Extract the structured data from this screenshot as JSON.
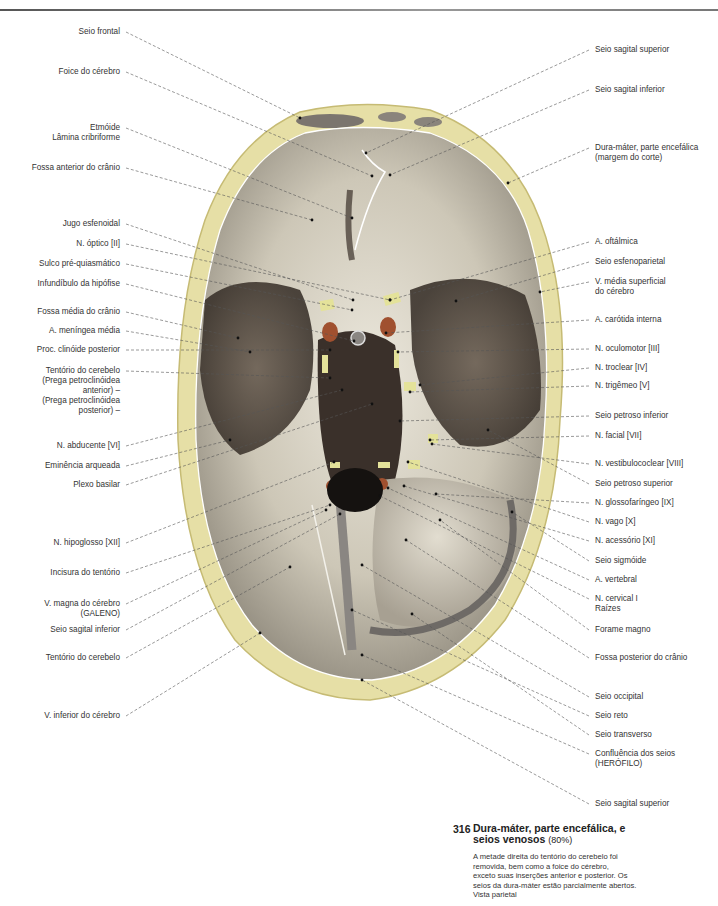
{
  "figure": {
    "number": "316",
    "title_line1": "Dura-máter, parte encefálica, e",
    "title_line2": "seios venosos",
    "scale": "(80%)",
    "description": [
      "A metade direita do tentório do cerebelo foi",
      "removida, bem como a foice do cérebro,",
      "exceto suas inserções anterior e posterior. Os",
      "seios da dura-máter estão parcialmente abertos.",
      "Vista parietal"
    ]
  },
  "labels_left": [
    {
      "lines": [
        "Seio frontal"
      ],
      "x": 120,
      "y": 32,
      "tx": 300,
      "ty": 118
    },
    {
      "lines": [
        "Foice do cérebro"
      ],
      "x": 120,
      "y": 72,
      "tx": 372,
      "ty": 176
    },
    {
      "lines": [
        "Etmóide",
        "Lâmina cribriforme"
      ],
      "x": 120,
      "y": 128,
      "tx": 352,
      "ty": 218
    },
    {
      "lines": [
        "Fossa anterior do crânio"
      ],
      "x": 120,
      "y": 168,
      "tx": 312,
      "ty": 220
    },
    {
      "lines": [
        "Jugo esfenoidal"
      ],
      "x": 120,
      "y": 224,
      "tx": 353,
      "ty": 300
    },
    {
      "lines": [
        "N. óptico [II]"
      ],
      "x": 120,
      "y": 244,
      "tx": 390,
      "ty": 300
    },
    {
      "lines": [
        "Sulco pré-quiasmático"
      ],
      "x": 120,
      "y": 264,
      "tx": 352,
      "ty": 310
    },
    {
      "lines": [
        "Infundíbulo da hipófise"
      ],
      "x": 120,
      "y": 284,
      "tx": 354,
      "ty": 341
    },
    {
      "lines": [
        "Fossa média do crânio"
      ],
      "x": 120,
      "y": 312,
      "tx": 238,
      "ty": 338
    },
    {
      "lines": [
        "A. meníngea média"
      ],
      "x": 120,
      "y": 331,
      "tx": 250,
      "ty": 352
    },
    {
      "lines": [
        "Proc. clinóide posterior"
      ],
      "x": 120,
      "y": 350,
      "tx": 330,
      "ty": 350
    },
    {
      "lines": [
        "Tentório do cerebelo",
        "(Prega petroclinóidea",
        "anterior) –",
        "(Prega petroclinóidea",
        "posterior) –"
      ],
      "x": 120,
      "y": 371,
      "tx": 330,
      "ty": 378
    },
    {
      "lines": [
        "N. abducente [VI]"
      ],
      "x": 120,
      "y": 446,
      "tx": 342,
      "ty": 390
    },
    {
      "lines": [
        "Eminência arqueada"
      ],
      "x": 120,
      "y": 466,
      "tx": 230,
      "ty": 440
    },
    {
      "lines": [
        "Plexo basilar"
      ],
      "x": 120,
      "y": 485,
      "tx": 372,
      "ty": 404
    },
    {
      "lines": [
        "N. hipoglosso [XII]"
      ],
      "x": 120,
      "y": 543,
      "tx": 334,
      "ty": 462
    },
    {
      "lines": [
        "Incisura do tentório"
      ],
      "x": 120,
      "y": 573,
      "tx": 330,
      "ty": 505
    },
    {
      "lines": [
        "V. magna do cérebro",
        "(GALENO)"
      ],
      "x": 120,
      "y": 604,
      "tx": 326,
      "ty": 510
    },
    {
      "lines": [
        "Seio sagital inferior"
      ],
      "x": 120,
      "y": 630,
      "tx": 340,
      "ty": 514
    },
    {
      "lines": [
        "Tentório do cerebelo"
      ],
      "x": 120,
      "y": 658,
      "tx": 290,
      "ty": 567
    },
    {
      "lines": [
        "V. inferior do cérebro"
      ],
      "x": 120,
      "y": 716,
      "tx": 260,
      "ty": 633
    }
  ],
  "labels_right": [
    {
      "lines": [
        "Seio sagital superior"
      ],
      "x": 595,
      "y": 50,
      "tx": 366,
      "ty": 153
    },
    {
      "lines": [
        "Seio sagital inferior"
      ],
      "x": 595,
      "y": 90,
      "tx": 390,
      "ty": 175
    },
    {
      "lines": [
        "Dura-máter, parte encefálica",
        "(margem do corte)"
      ],
      "x": 595,
      "y": 148,
      "tx": 508,
      "ty": 183
    },
    {
      "lines": [
        "A. oftálmica"
      ],
      "x": 595,
      "y": 242,
      "tx": 390,
      "ty": 300
    },
    {
      "lines": [
        "Seio esfenoparietal"
      ],
      "x": 595,
      "y": 262,
      "tx": 456,
      "ty": 301
    },
    {
      "lines": [
        "V. média superficial",
        "do cérebro"
      ],
      "x": 595,
      "y": 282,
      "tx": 540,
      "ty": 292
    },
    {
      "lines": [
        "A. carótida interna"
      ],
      "x": 595,
      "y": 320,
      "tx": 386,
      "ty": 333
    },
    {
      "lines": [
        "N. oculomotor [III]"
      ],
      "x": 595,
      "y": 349,
      "tx": 398,
      "ty": 352
    },
    {
      "lines": [
        "N. troclear [IV]"
      ],
      "x": 595,
      "y": 368,
      "tx": 420,
      "ty": 385
    },
    {
      "lines": [
        "N. trigêmeo [V]"
      ],
      "x": 595,
      "y": 386,
      "tx": 410,
      "ty": 392
    },
    {
      "lines": [
        "Seio petroso inferior"
      ],
      "x": 595,
      "y": 416,
      "tx": 400,
      "ty": 421
    },
    {
      "lines": [
        "N. facial [VII]"
      ],
      "x": 595,
      "y": 436,
      "tx": 430,
      "ty": 440
    },
    {
      "lines": [
        "N. vestibulococlear [VIII]"
      ],
      "x": 595,
      "y": 464,
      "tx": 432,
      "ty": 444
    },
    {
      "lines": [
        "Seio petroso superior"
      ],
      "x": 595,
      "y": 484,
      "tx": 488,
      "ty": 430
    },
    {
      "lines": [
        "N. glossofaríngeo [IX]"
      ],
      "x": 595,
      "y": 503,
      "tx": 436,
      "ty": 494
    },
    {
      "lines": [
        "N. vago [X]"
      ],
      "x": 595,
      "y": 522,
      "tx": 408,
      "ty": 462
    },
    {
      "lines": [
        "N. acessório [XI]"
      ],
      "x": 595,
      "y": 541,
      "tx": 404,
      "ty": 486
    },
    {
      "lines": [
        "Seio sigmóide"
      ],
      "x": 595,
      "y": 561,
      "tx": 512,
      "ty": 512
    },
    {
      "lines": [
        "A. vertebral"
      ],
      "x": 595,
      "y": 580,
      "tx": 388,
      "ty": 488
    },
    {
      "lines": [
        "N. cervical I",
        "Raízes"
      ],
      "x": 595,
      "y": 599,
      "tx": 380,
      "ty": 496
    },
    {
      "lines": [
        "Forame magno"
      ],
      "x": 595,
      "y": 630,
      "tx": 440,
      "ty": 520
    },
    {
      "lines": [
        "Fossa posterior do crânio"
      ],
      "x": 595,
      "y": 658,
      "tx": 406,
      "ty": 540
    },
    {
      "lines": [
        "Seio occipital"
      ],
      "x": 595,
      "y": 697,
      "tx": 362,
      "ty": 565
    },
    {
      "lines": [
        "Seio reto"
      ],
      "x": 595,
      "y": 716,
      "tx": 352,
      "ty": 610
    },
    {
      "lines": [
        "Seio transverso"
      ],
      "x": 595,
      "y": 735,
      "tx": 412,
      "ty": 614
    },
    {
      "lines": [
        "Confluência dos seios",
        "(HERÓFILO)"
      ],
      "x": 595,
      "y": 754,
      "tx": 362,
      "ty": 655
    },
    {
      "lines": [
        "Seio sagital superior"
      ],
      "x": 595,
      "y": 804,
      "tx": 362,
      "ty": 680
    }
  ],
  "colors": {
    "bone": "#e6dfa6",
    "bone_dark": "#c9bf7a",
    "dura_light": "#d8d3c4",
    "dura_mid": "#9c968a",
    "dura_dark": "#4a4038",
    "nerve": "#e4e29a",
    "artery": "#a0502f",
    "leader": "#555555"
  }
}
